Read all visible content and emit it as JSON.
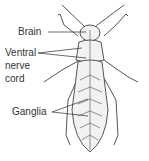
{
  "diagram": {
    "labels": {
      "brain": "Brain",
      "ventral_nerve_cord_line1": "Ventral",
      "ventral_nerve_cord_line2": "nerve",
      "ventral_nerve_cord_line3": "cord",
      "ganglia": "Ganglia"
    },
    "colors": {
      "outline": "#555555",
      "fill": "#f2f2f2",
      "text": "#333333"
    }
  }
}
